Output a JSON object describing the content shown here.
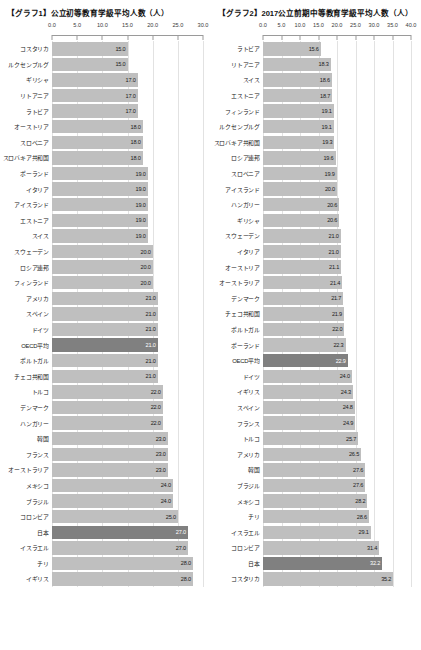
{
  "charts": [
    {
      "title": "【グラフ1】公立初等教育学級平均人数（人）",
      "unit": "人",
      "axis_ticks": [
        "0.0",
        "5.0",
        "10.0",
        "15.0",
        "20.0",
        "25.0",
        "30.0"
      ],
      "axis_min": 0,
      "axis_max": 30,
      "highlight_color": "#808080",
      "bar_color": "#bfbfbf",
      "highlight_labels": [
        "OECD平均",
        "日本"
      ]
    },
    {
      "title": "【グラフ2】2017公立前期中等教育学級平均人数（人）",
      "unit": "人",
      "axis_ticks": [
        "0.0",
        "5.0",
        "10.0",
        "15.0",
        "20.0",
        "25.0",
        "30.0",
        "35.0",
        "40.0"
      ],
      "axis_min": 0,
      "axis_max": 40,
      "highlight_color": "#808080",
      "bar_color": "#bfbfbf",
      "highlight_labels": [
        "OECD平均",
        "日本"
      ]
    }
  ],
  "chart_data": [
    {
      "type": "bar",
      "orientation": "horizontal",
      "title": "【グラフ1】公立初等教育学級平均人数（人）",
      "xlabel": "",
      "ylabel": "",
      "xlim": [
        0,
        30
      ],
      "grid": true,
      "legend": "none",
      "tick_labels": [
        "0.0",
        "5.0",
        "10.0",
        "15.0",
        "20.0",
        "25.0",
        "30.0"
      ],
      "categories": [
        "コスタリカ",
        "ルクセンブルグ",
        "ギリシャ",
        "リトアニア",
        "ラトビア",
        "オーストリア",
        "スロベニア",
        "スロバキア共和国",
        "ポーランド",
        "イタリア",
        "アイスランド",
        "エストニア",
        "スイス",
        "スウェーデン",
        "ロシア連邦",
        "フィンランド",
        "アメリカ",
        "スペイン",
        "ドイツ",
        "OECD平均",
        "ポルトガル",
        "チェコ共和国",
        "トルコ",
        "デンマーク",
        "ハンガリー",
        "韓国",
        "フランス",
        "オーストラリア",
        "メキシコ",
        "ブラジル",
        "コロンビア",
        "日本",
        "イスラエル",
        "チリ",
        "イギリス"
      ],
      "values": [
        15.0,
        15.0,
        17.0,
        17.0,
        17.0,
        18.0,
        18.0,
        18.0,
        19.0,
        19.0,
        19.0,
        19.0,
        19.0,
        20.0,
        20.0,
        20.0,
        21.0,
        21.0,
        21.0,
        21.0,
        21.0,
        21.0,
        22.0,
        22.0,
        22.0,
        23.0,
        23.0,
        23.0,
        24.0,
        24.0,
        25.0,
        27.0,
        27.0,
        28.0,
        28.0
      ],
      "value_labels": [
        "15.0",
        "15.0",
        "17.0",
        "17.0",
        "17.0",
        "18.0",
        "18.0",
        "18.0",
        "19.0",
        "19.0",
        "19.0",
        "19.0",
        "19.0",
        "20.0",
        "20.0",
        "20.0",
        "21.0",
        "21.0",
        "21.0",
        "21.0",
        "21.0",
        "21.0",
        "22.0",
        "22.0",
        "22.0",
        "23.0",
        "23.0",
        "23.0",
        "24.0",
        "24.0",
        "25.0",
        "27.0",
        "27.0",
        "28.0",
        "28.0"
      ]
    },
    {
      "type": "bar",
      "orientation": "horizontal",
      "title": "【グラフ2】2017公立前期中等教育学級平均人数（人）",
      "xlabel": "",
      "ylabel": "",
      "xlim": [
        0,
        40
      ],
      "grid": true,
      "legend": "none",
      "tick_labels": [
        "0.0",
        "5.0",
        "10.0",
        "15.0",
        "20.0",
        "25.0",
        "30.0",
        "35.0",
        "40.0"
      ],
      "categories": [
        "ラトビア",
        "リトアニア",
        "スイス",
        "エストニア",
        "フィンランド",
        "ルクセンブルグ",
        "スロバキア共和国",
        "ロシア連邦",
        "スロベニア",
        "アイスランド",
        "ハンガリー",
        "ギリシャ",
        "スウェーデン",
        "イタリア",
        "オーストリア",
        "オーストラリア",
        "デンマーク",
        "チェコ共和国",
        "ポルトガル",
        "ポーランド",
        "OECD平均",
        "ドイツ",
        "イギリス",
        "スペイン",
        "フランス",
        "トルコ",
        "アメリカ",
        "韓国",
        "ブラジル",
        "メキシコ",
        "チリ",
        "イスラエル",
        "コロンビア",
        "日本",
        "コスタリカ"
      ],
      "values": [
        15.6,
        18.3,
        18.6,
        18.7,
        19.1,
        19.1,
        19.3,
        19.6,
        19.9,
        20.0,
        20.6,
        20.6,
        21.0,
        21.0,
        21.1,
        21.4,
        21.7,
        21.9,
        22.0,
        22.3,
        22.9,
        24.0,
        24.3,
        24.8,
        24.9,
        25.7,
        26.5,
        27.6,
        27.6,
        28.2,
        28.6,
        29.1,
        31.4,
        32.2,
        35.2
      ],
      "value_labels": [
        "15.6",
        "18.3",
        "18.6",
        "18.7",
        "19.1",
        "19.1",
        "19.3",
        "19.6",
        "19.9",
        "20.0",
        "20.6",
        "20.6",
        "21.0",
        "21.0",
        "21.1",
        "21.4",
        "21.7",
        "21.9",
        "22.0",
        "22.3",
        "22.9",
        "24.0",
        "24.3",
        "24.8",
        "24.9",
        "25.7",
        "26.5",
        "27.6",
        "27.6",
        "28.2",
        "28.6",
        "29.1",
        "31.4",
        "32.2",
        "35.2"
      ]
    }
  ]
}
